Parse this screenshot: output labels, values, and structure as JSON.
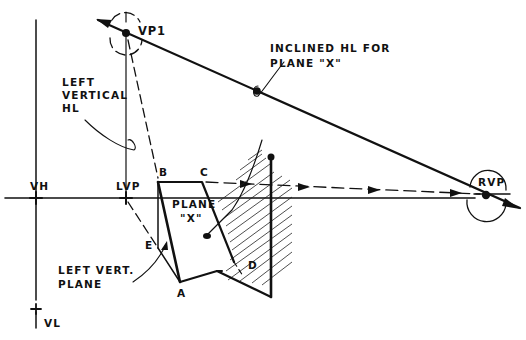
{
  "diagram": {
    "type": "perspective-drawing",
    "labels": {
      "vp1": "VP1",
      "inclined_hl_line1": "INCLINED HL FOR",
      "inclined_hl_line2": "PLANE \"X\"",
      "left_vertical_hl_line1": "LEFT",
      "left_vertical_hl_line2": "VERTICAL",
      "left_vertical_hl_line3": "HL",
      "vh": "VH",
      "lvp": "LVP",
      "rvp": "RVP",
      "point_b": "B",
      "point_c": "C",
      "point_a": "A",
      "point_d": "D",
      "point_e": "E",
      "plane_x_line1": "PLANE",
      "plane_x_line2": "\"X\"",
      "left_vert_plane_line1": "LEFT VERT.",
      "left_vert_plane_line2": "PLANE",
      "vl": "VL"
    },
    "colors": {
      "ink": "#111111",
      "background": "#ffffff"
    }
  }
}
